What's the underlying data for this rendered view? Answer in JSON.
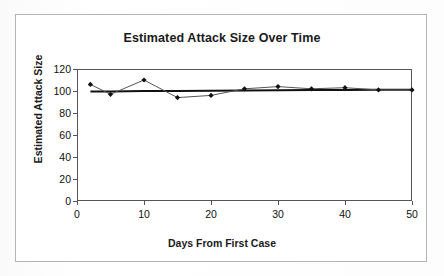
{
  "document": {
    "background_color": "#ffffff",
    "frame_border_color": "#b4b4b4"
  },
  "chart_data": {
    "type": "line",
    "title": "Estimated Attack Size Over Time",
    "xlabel": "Days From First Case",
    "ylabel": "Estimated Attack Size",
    "xlim": [
      0,
      50
    ],
    "ylim": [
      0,
      120
    ],
    "xticks": [
      0,
      10,
      20,
      30,
      40,
      50
    ],
    "yticks": [
      0,
      20,
      40,
      60,
      80,
      100,
      120
    ],
    "xtick_labels": [
      "0",
      "10",
      "20",
      "30",
      "40",
      "50"
    ],
    "ytick_labels": [
      "0",
      "20",
      "40",
      "60",
      "80",
      "100",
      "120"
    ],
    "grid": false,
    "legend": false,
    "legend_position": "none",
    "marker": "diamond",
    "marker_color": "#111111",
    "line_color": "#555555",
    "trendline_color": "#111111",
    "x": [
      2,
      5,
      10,
      15,
      20,
      25,
      30,
      35,
      40,
      45,
      50
    ],
    "series": [
      {
        "name": "Estimated Attack Size",
        "values": [
          106,
          97,
          110,
          94,
          96,
          102,
          104,
          102,
          103,
          101,
          101
        ]
      },
      {
        "name": "Trendline",
        "type": "line",
        "values": [
          99.5,
          99.6,
          99.9,
          100.1,
          100.3,
          100.5,
          100.7,
          100.8,
          101.0,
          101.1,
          101.2
        ]
      }
    ]
  }
}
